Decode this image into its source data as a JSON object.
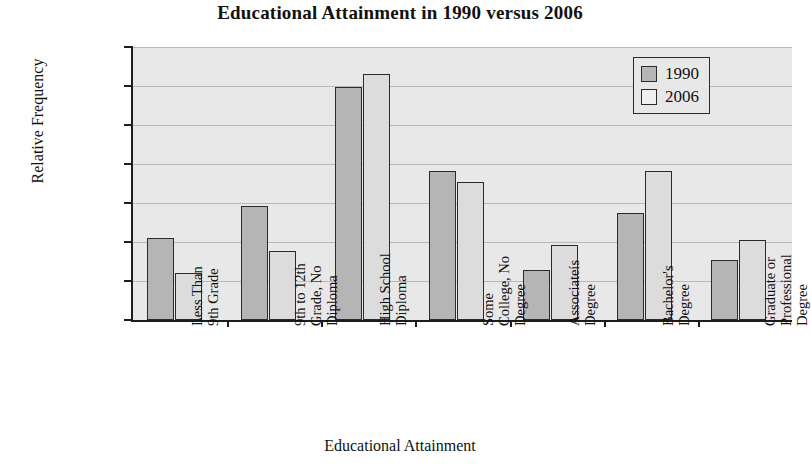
{
  "chart_data": {
    "type": "bar",
    "title": "Educational Attainment in 1990 versus 2006",
    "xlabel": "Educational Attainment",
    "ylabel": "Relative Frequency",
    "ylim": [
      0.0,
      0.35
    ],
    "ytick_step": 0.05,
    "ytick_labels": [
      "0.0000",
      "0.0500",
      "0.1000",
      "0.1500",
      "0.2000",
      "0.2500",
      "0.3000",
      "0.3500"
    ],
    "ytick_values": [
      0.0,
      0.05,
      0.1,
      0.15,
      0.2,
      0.25,
      0.3,
      0.35
    ],
    "grid": true,
    "legend_position": "top-right",
    "categories": [
      "Less Than 9th Grade",
      "9th to 12th Grade, No Diploma",
      "High School Diploma",
      "Some College, No Degree",
      "Associateís Degree",
      "Bachelor's Degree",
      "Graduate or Professional Degree"
    ],
    "category_lines": [
      [
        "Less Than",
        "9th Grade"
      ],
      [
        "9th to 12th",
        "Grade, No",
        "Diploma"
      ],
      [
        "High School",
        "Diploma"
      ],
      [
        "Some",
        "College, No",
        "Degree"
      ],
      [
        "Associateís",
        "Degree"
      ],
      [
        "Bachelor's",
        "Degree"
      ],
      [
        "Graduate or",
        "Professional",
        "Degree"
      ]
    ],
    "series": [
      {
        "name": "1990",
        "color": "#b5b5b5",
        "values": [
          0.1055,
          0.1465,
          0.2985,
          0.1915,
          0.0645,
          0.1375,
          0.0775
        ]
      },
      {
        "name": "2006",
        "color": "#dcdcdc",
        "values": [
          0.0605,
          0.0885,
          0.3155,
          0.1775,
          0.0965,
          0.1905,
          0.1025
        ]
      }
    ]
  },
  "legend": {
    "entries": [
      {
        "label": "1990"
      },
      {
        "label": "2006"
      }
    ]
  }
}
